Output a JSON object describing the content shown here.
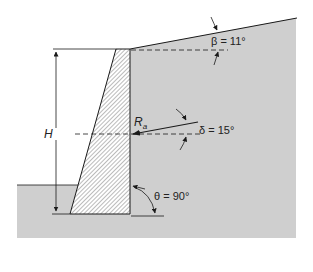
{
  "diagram": {
    "colors": {
      "soil": "#cfcfcf",
      "line": "#1a1a1a",
      "background": "#ffffff"
    },
    "labels": {
      "height": "H",
      "resultant": "R",
      "resultant_sub": "a",
      "beta": "β = 11°",
      "delta": "δ = 15°",
      "theta": "θ = 90°"
    },
    "parameters": {
      "beta_deg": 11,
      "delta_deg": 15,
      "theta_deg": 90
    }
  }
}
